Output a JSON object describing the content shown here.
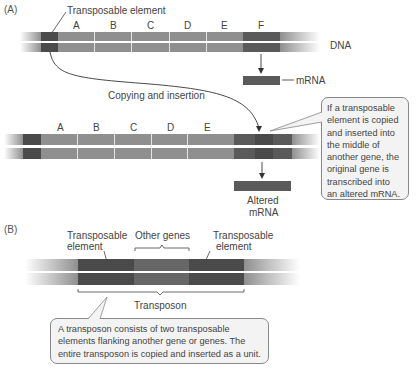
{
  "panel_a": {
    "label": "(A)",
    "te_label": "Transposable element",
    "genes": [
      "A",
      "B",
      "C",
      "D",
      "E",
      "F"
    ],
    "dna_label": "DNA",
    "mrna_label": "mRNA",
    "copy_label": "Copying and insertion",
    "inserted_genes": [
      "A",
      "B",
      "C",
      "D",
      "E"
    ],
    "altered_mrna_label_line1": "Altered",
    "altered_mrna_label_line2": "mRNA",
    "callout_lines": [
      "If a transposable",
      "element is copied",
      "and inserted into",
      "the middle of",
      "another gene, the",
      "original gene is",
      "transcribed into",
      "an altered mRNA."
    ]
  },
  "panel_b": {
    "label": "(B)",
    "te_left_line1": "Transposable",
    "te_left_line2": "element",
    "other_genes": "Other genes",
    "te_right_line1": "Transposable",
    "te_right_line2": "element",
    "transposon_label": "Transposon",
    "callout_lines": [
      "A transposon consists of two transposable",
      "elements flanking another gene or genes. The",
      "entire transposon is copied and inserted as a unit."
    ]
  },
  "colors": {
    "gene_light": "#8f8f8f",
    "element_dark": "#4a4a4a",
    "callout_bg": "#f3f3f3"
  }
}
